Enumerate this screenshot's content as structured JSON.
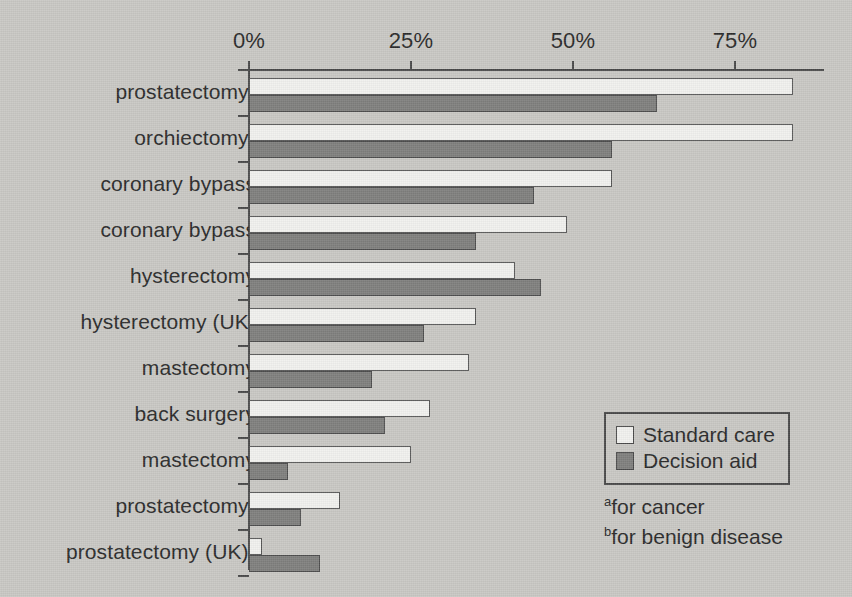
{
  "chart_data": {
    "type": "bar",
    "orientation": "horizontal",
    "title": "",
    "xlabel": "",
    "ylabel": "",
    "xlim": [
      0,
      88
    ],
    "grid": false,
    "xticks": [
      "0%",
      "25%",
      "50%",
      "75%"
    ],
    "xtick_values": [
      0,
      25,
      50,
      75
    ],
    "legend_position": "inside-bottom-right",
    "categories": [
      "prostatectomyᵃ",
      "orchiectomyᵃ",
      "coronary bypass",
      "coronary bypass",
      "hysterectomy",
      "hysterectomy (UK)",
      "mastectomy",
      "back surgery",
      "mastectomy",
      "prostatectomyᵇ",
      "prostatectomy (UK)ᵇ"
    ],
    "category_parts": [
      {
        "text": "prostatectomy",
        "sup": "a"
      },
      {
        "text": "orchiectomy",
        "sup": "a"
      },
      {
        "text": "coronary bypass",
        "sup": ""
      },
      {
        "text": "coronary bypass",
        "sup": ""
      },
      {
        "text": "hysterectomy",
        "sup": ""
      },
      {
        "text": "hysterectomy (UK)",
        "sup": ""
      },
      {
        "text": "mastectomy",
        "sup": ""
      },
      {
        "text": "back surgery",
        "sup": ""
      },
      {
        "text": "mastectomy",
        "sup": ""
      },
      {
        "text": "prostatectomy",
        "sup": "b"
      },
      {
        "text": "prostatectomy (UK)",
        "sup": "b"
      }
    ],
    "series": [
      {
        "name": "Standard care",
        "color": "#f1f1ee",
        "values": [
          84,
          84,
          56,
          49,
          41,
          35,
          34,
          28,
          25,
          14,
          2
        ]
      },
      {
        "name": "Decision aid",
        "color": "#7f7f7d",
        "values": [
          63,
          56,
          44,
          35,
          45,
          27,
          19,
          21,
          6,
          8,
          11
        ]
      }
    ]
  },
  "legend": {
    "items": [
      {
        "label": "Standard care",
        "swatch": "standard"
      },
      {
        "label": "Decision aid",
        "swatch": "aid"
      }
    ]
  },
  "footnotes": [
    {
      "marker": "a",
      "text": "for cancer"
    },
    {
      "marker": "b",
      "text": "for benign disease"
    }
  ],
  "colors": {
    "background": "#c9c8c4",
    "axis": "#4a4a4a",
    "text": "#2b2b2b",
    "standard_care": "#f1f1ee",
    "decision_aid": "#7f7f7d"
  }
}
